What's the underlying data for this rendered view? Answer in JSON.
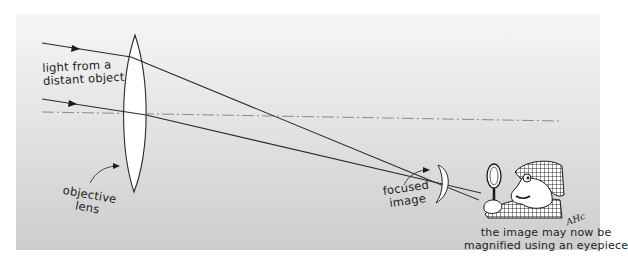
{
  "diagram": {
    "labels": {
      "incoming_light_line1": "light from a",
      "incoming_light_line2": "distant object",
      "objective_line1": "objective",
      "objective_line2": "lens",
      "focused_line1": "focused",
      "focused_line2": "image",
      "caption_line1": "the image may now be",
      "caption_line2": "magnified using an eyepiece",
      "signature": "AHc"
    },
    "elements": [
      "incoming-ray-top",
      "incoming-ray-bottom",
      "optical-axis",
      "objective-lens",
      "focused-image",
      "detective-with-magnifying-glass"
    ],
    "colors": {
      "background_top": "#f6f6f6",
      "background_bottom": "#cdcdcd",
      "ray": "#2a2a2a",
      "axis": "#8a8a8a",
      "lens_fill": "#ffffff"
    }
  }
}
